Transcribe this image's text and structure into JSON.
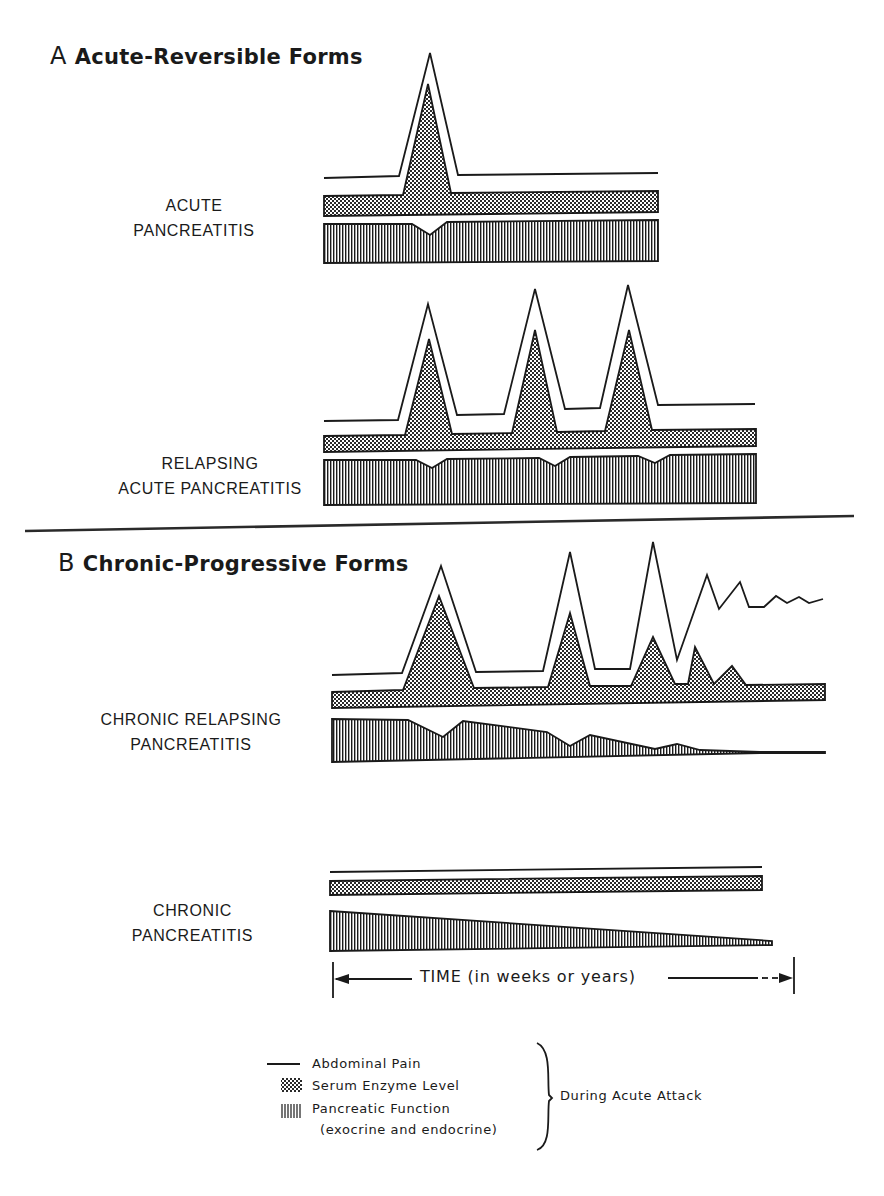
{
  "figure": {
    "section_a": {
      "letter": "A",
      "title": "Acute-Reversible Forms"
    },
    "section_b": {
      "letter": "B",
      "title": "Chronic-Progressive Forms"
    },
    "rows": [
      {
        "id": "acute",
        "label_line1": "ACUTE",
        "label_line2": "PANCREATITIS"
      },
      {
        "id": "relapsing-acute",
        "label_line1": "RELAPSING",
        "label_line2": "ACUTE  PANCREATITIS"
      },
      {
        "id": "chronic-relapsing",
        "label_line1": "CHRONIC RELAPSING",
        "label_line2": "PANCREATITIS"
      },
      {
        "id": "chronic",
        "label_line1": "CHRONIC",
        "label_line2": "PANCREATITIS"
      }
    ],
    "time_axis": {
      "label": "TIME (in weeks or years)"
    },
    "legend": {
      "items": [
        {
          "symbol": "solid-line",
          "label": "Abdominal Pain"
        },
        {
          "symbol": "stipple",
          "label": "Serum Enzyme Level"
        },
        {
          "symbol": "vertical-hatch",
          "label": "Pancreatic Function"
        }
      ],
      "sub_label": "(exocrine and endocrine)",
      "bracket_label": "During Acute Attack"
    },
    "colors": {
      "ink": "#1a1a1a",
      "background": "#ffffff"
    }
  }
}
